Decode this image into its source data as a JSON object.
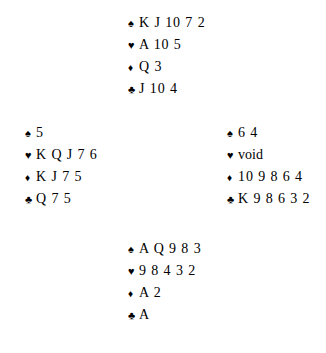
{
  "diagram": {
    "kind": "bridge-hand-deal-diagram",
    "background_color": "#ffffff",
    "text_color": "#000000",
    "symbols": {
      "spade": "♠",
      "heart": "♥",
      "diamond": "♦",
      "club": "♣"
    },
    "hands": {
      "north": {
        "spades": "K J 10 7 2",
        "hearts": "A 10 5",
        "diamonds": "Q 3",
        "clubs": "J 10 4"
      },
      "west": {
        "spades": "5",
        "hearts": "K Q J 7 6",
        "diamonds": "K J 7 5",
        "clubs": "Q 7 5"
      },
      "east": {
        "spades": "6 4",
        "hearts": "void",
        "diamonds": "10 9 8 6 4",
        "clubs": "K 9 8 6 3 2"
      },
      "south": {
        "spades": "A Q 9 8 3",
        "hearts": "9 8 4 3 2",
        "diamonds": "A 2",
        "clubs": "A"
      }
    }
  }
}
